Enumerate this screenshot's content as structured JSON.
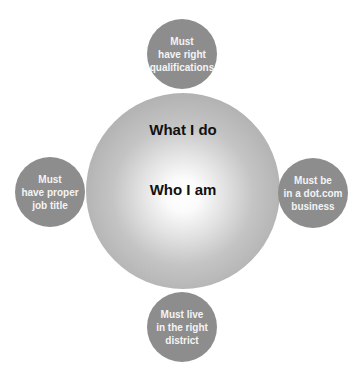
{
  "diagram": {
    "center": {
      "outer_label": "What I do",
      "inner_label": "Who I am"
    },
    "satellites": [
      {
        "position": "top",
        "label": "Must\nhave right\nqualifications"
      },
      {
        "position": "left",
        "label": "Must\nhave proper\njob title"
      },
      {
        "position": "right",
        "label": "Must be\nin a dot.com\nbusiness"
      },
      {
        "position": "bottom",
        "label": "Must live\nin the right\ndistrict"
      }
    ],
    "colors": {
      "satellite_fill": "#8d8d8d",
      "center_edge": "#a6a6a6",
      "center_core": "#ffffff"
    }
  }
}
